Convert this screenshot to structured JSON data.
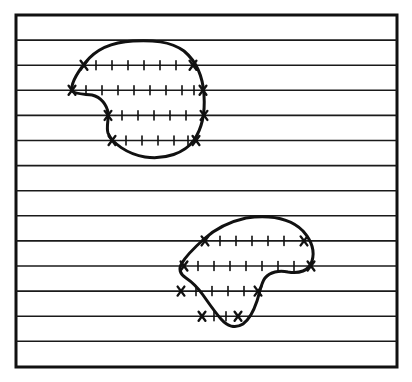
{
  "figure": {
    "title": "Scan-line traversal of two closed regions",
    "background_color": "#ffffff",
    "ink_color": "#111111",
    "width": 412,
    "height": 382
  },
  "frame": {
    "name": "outer-border",
    "x": 16,
    "y": 15,
    "width": 381,
    "height": 352,
    "stroke_width": 3,
    "color": "#111111"
  },
  "scan_lines": {
    "count": 13,
    "spacing": 25.1,
    "stroke_width": 1.6,
    "color": "#1a1a1a",
    "x_start": 16,
    "x_end": 397,
    "y_values": [
      40.1,
      65.2,
      90.3,
      115.4,
      140.5,
      165.6,
      190.7,
      215.8,
      240.9,
      266.0,
      291.1,
      316.2,
      341.3
    ]
  },
  "regions": [
    {
      "name": "upper-region",
      "label": "upper closed curve",
      "stroke_width": 3,
      "color": "#111111",
      "bounds": {
        "x": 70,
        "y": 40,
        "width": 134,
        "height": 118
      },
      "path": "M 133 41 C 112 42 95 50 85 63 C 74 77 71 86 72 91 C 74 94 84 94 92 95 C 101 97 107 105 108 113 C 109 119 106 127 108 133 C 112 143 127 154 145 157 C 165 160 185 153 194 140 C 203 127 205 110 204 95 C 203 78 197 62 184 51 C 170 41 152 40 133 41 Z",
      "spans": [
        {
          "y": 65.2,
          "x1": 84.0,
          "x2": 193.0,
          "ticks": [
            96,
            112,
            128,
            144,
            160,
            176
          ]
        },
        {
          "y": 90.3,
          "x1": 72.0,
          "x2": 203.0,
          "ticks": [
            86,
            102,
            118,
            134,
            150,
            166,
            182,
            194
          ]
        },
        {
          "y": 115.4,
          "x1": 108.0,
          "x2": 204.0,
          "ticks": [
            122,
            138,
            154,
            170,
            186
          ]
        },
        {
          "y": 140.5,
          "x1": 112.0,
          "x2": 196.0,
          "ticks": [
            126,
            142,
            158,
            174,
            188
          ]
        }
      ]
    },
    {
      "name": "lower-region",
      "label": "lower closed curve",
      "stroke_width": 3,
      "color": "#111111",
      "bounds": {
        "x": 180,
        "y": 216,
        "width": 133,
        "height": 113
      },
      "path": "M 246 218 C 228 222 214 230 204 239 C 194 248 186 256 182 263 C 178 269 180 274 186 278 C 192 282 198 288 203 295 C 208 302 214 311 221 319 C 227 326 235 329 243 324 C 250 319 254 310 257 301 C 260 292 261 283 265 278 C 270 272 279 270 288 272 C 299 274 309 271 312 261 C 315 251 311 240 303 231 C 293 221 276 214 246 218 Z",
      "spans": [
        {
          "y": 240.9,
          "x1": 205.0,
          "x2": 304.0,
          "ticks": [
            220,
            236,
            252,
            268,
            284
          ]
        },
        {
          "y": 266.0,
          "x1": 184.0,
          "x2": 311.0,
          "ticks": [
            198,
            214,
            230,
            246,
            262,
            278,
            294
          ]
        },
        {
          "y": 291.1,
          "x1": 181.0,
          "x2": 258.0,
          "ticks": [
            196,
            212,
            228,
            244
          ]
        },
        {
          "y": 316.2,
          "x1": 202.0,
          "x2": 238.0,
          "ticks": [
            214,
            226
          ]
        }
      ]
    }
  ],
  "markers": {
    "cross": {
      "name": "crossing-marker",
      "glyph": "X",
      "size": 9,
      "stroke_width": 2.4,
      "meaning": "intersection of a scan line with a region boundary"
    },
    "tick": {
      "name": "interior-tick",
      "length": 9,
      "stroke_width": 1.6,
      "meaning": "sample point along an interior span"
    }
  }
}
